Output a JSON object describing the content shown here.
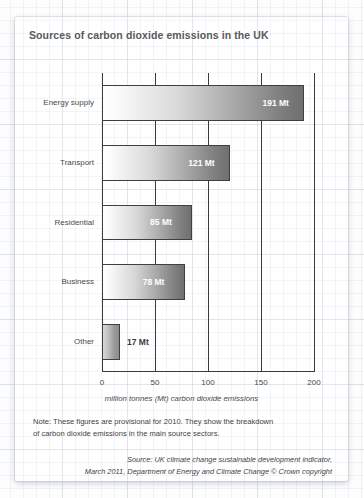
{
  "chart_data": {
    "type": "bar",
    "orientation": "horizontal",
    "title": "Sources of carbon dioxide emissions in the UK",
    "categories": [
      "Energy supply",
      "Transport",
      "Residential",
      "Business",
      "Other"
    ],
    "values": [
      191,
      121,
      85,
      78,
      17
    ],
    "value_labels": [
      "191 Mt",
      "121 Mt",
      "85 Mt",
      "78 Mt",
      "17 Mt"
    ],
    "xlabel": "million tonnes (Mt) carbon dioxide emissions",
    "ylabel": "",
    "xlim": [
      0,
      200
    ],
    "xticks": [
      0,
      50,
      100,
      150,
      200
    ],
    "xtick_labels": [
      "0",
      "50",
      "100",
      "150",
      "200"
    ],
    "grid": true,
    "legend": "none",
    "unit": "Mt",
    "bar_fill": "#a8a8a8",
    "bar_outline": "#3f3f3f"
  },
  "note": {
    "line1": "Note: These figures are provisional for 2010. They show the breakdown",
    "line2": "of carbon dioxide emissions in the main source sectors."
  },
  "source": {
    "line1": "Source: UK climate change sustainable development indicator,",
    "line2": "March 2011, Department of Energy and Climate Change © Crown copyright"
  }
}
